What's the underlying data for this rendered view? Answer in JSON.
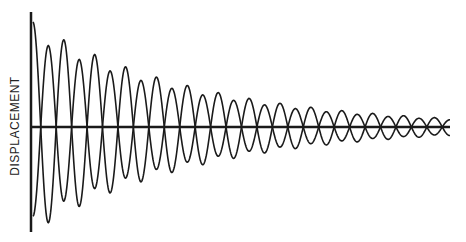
{
  "chart_data": {
    "type": "line",
    "title": "",
    "xlabel": "",
    "ylabel": "DISPLACEMENT",
    "grid": false,
    "legend": "none",
    "ylim": [
      -1,
      1
    ],
    "xlim": [
      0,
      14
    ],
    "series": [
      {
        "name": "oscillation-a",
        "amplitude": 1.0,
        "decay_per_cycle": 0.12,
        "cycles": 13.5,
        "phase_deg": 90
      },
      {
        "name": "oscillation-b",
        "amplitude": 0.85,
        "decay_per_cycle": 0.12,
        "cycles": 13.5,
        "phase_deg": -90
      }
    ]
  },
  "colors": {
    "ink": "#1a1a1a",
    "background": "#ffffff"
  }
}
